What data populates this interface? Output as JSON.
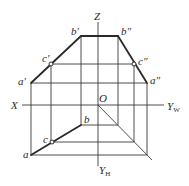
{
  "diagram": {
    "title": "",
    "type": "three-view orthographic projection of a line segment AB with point C",
    "axes": {
      "z_label": "Z",
      "x_label": "X",
      "origin_label": "O",
      "yw_label": "Y",
      "yw_sub": "W",
      "yh_label": "Y",
      "yh_sub": "H"
    },
    "points": {
      "front": {
        "a": "a′",
        "b": "b′",
        "c": "c′"
      },
      "side": {
        "a": "a″",
        "b": "b″",
        "c": "c″"
      },
      "top": {
        "a": "a",
        "b": "b",
        "c": "c"
      }
    },
    "colors": {
      "line": "#2a2a2a",
      "background": "#ffffff"
    }
  }
}
